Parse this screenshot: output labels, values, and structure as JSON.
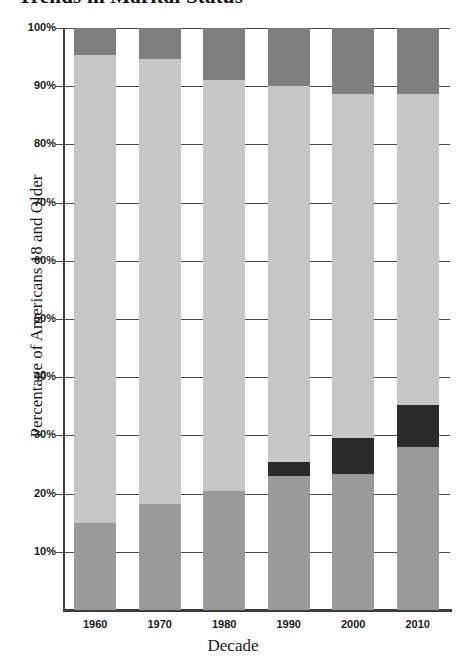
{
  "chart_data": {
    "type": "bar",
    "subtype": "stacked-bar-100-percent",
    "title": "Trends in Marital Status",
    "xlabel": "Decade",
    "ylabel": "Percentage of Americans 18 and Older",
    "categories": [
      "1960",
      "1970",
      "1980",
      "1990",
      "2000",
      "2010"
    ],
    "ylim": [
      0,
      100
    ],
    "ytick_labels": [
      "10%",
      "20%",
      "30%",
      "40%",
      "50%",
      "60%",
      "70%",
      "80%",
      "90%",
      "100%"
    ],
    "ytick_values": [
      10,
      20,
      30,
      40,
      50,
      60,
      70,
      80,
      90,
      100
    ],
    "grid": true,
    "legend_position": "none",
    "series": [
      {
        "name": "segment-1-bottom",
        "color": "#9a9a9a",
        "values": [
          15.0,
          18.2,
          20.5,
          23.0,
          23.4,
          28.0
        ]
      },
      {
        "name": "segment-2-black",
        "color": "#2b2b2b",
        "values": [
          0.0,
          0.0,
          0.0,
          2.4,
          6.2,
          7.2
        ]
      },
      {
        "name": "segment-3-light",
        "color": "#c6c6c6",
        "values": [
          80.4,
          76.4,
          70.5,
          64.6,
          59.1,
          53.5
        ]
      },
      {
        "name": "segment-4-top",
        "color": "#7e7e7e",
        "values": [
          4.6,
          5.4,
          9.0,
          10.0,
          11.3,
          11.3
        ]
      }
    ]
  },
  "axis": {
    "x_title": "Decade",
    "y_title": "Percentage of Americans 18 and Older"
  },
  "colors": {
    "segment_bottom": "#9a9a9a",
    "segment_black": "#2b2b2b",
    "segment_light": "#c6c6c6",
    "segment_top": "#7e7e7e",
    "gridline": "#4a4a4a",
    "axis": "#3d3d3d",
    "background": "#ffffff",
    "text": "#1a1a1a"
  }
}
